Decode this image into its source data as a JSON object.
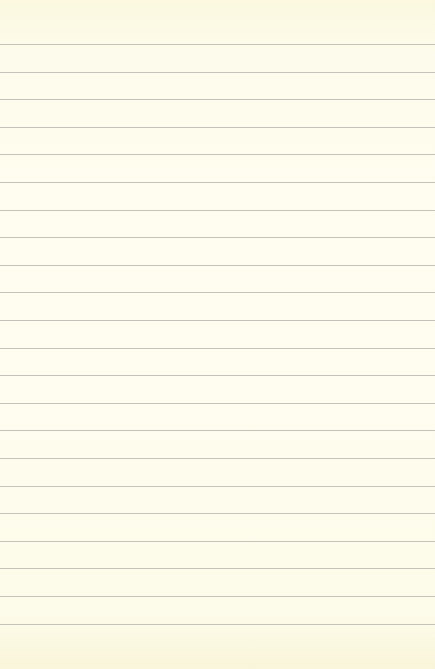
{
  "page": {
    "type": "lined-notepad-page",
    "background_color": "#fdfbe8",
    "rule_color": "#b9b9b2",
    "rule_count": 22,
    "first_rule_y": 44,
    "rule_spacing": 27.6,
    "text": ""
  }
}
